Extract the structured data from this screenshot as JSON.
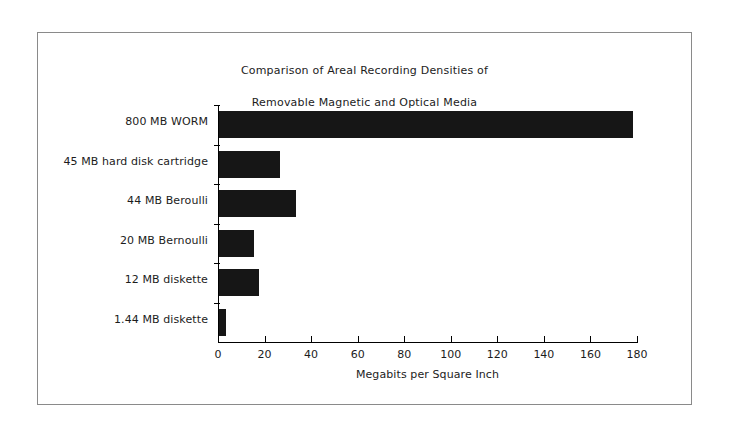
{
  "chart_data": {
    "type": "bar",
    "orientation": "horizontal",
    "title": "Comparison of Areal Recording Densities of\nRemovable Magnetic and Optical Media",
    "title_line1": "Comparison of Areal Recording Densities of",
    "title_line2": "Removable Magnetic and Optical Media",
    "xlabel": "Megabits per Square Inch",
    "ylabel": "",
    "categories": [
      "800 MB WORM",
      "45 MB hard disk cartridge",
      "44 MB Beroulli",
      "20 MB Bernoulli",
      "12 MB diskette",
      "1.44 MB diskette"
    ],
    "values": [
      178,
      26,
      33,
      15,
      17,
      3
    ],
    "xlim": [
      0,
      180
    ],
    "xticks": [
      0,
      20,
      40,
      60,
      80,
      100,
      120,
      140,
      160,
      180
    ],
    "xtick_labels": [
      "0",
      "20",
      "40",
      "60",
      "80",
      "100",
      "120",
      "140",
      "160",
      "180"
    ],
    "grid": false,
    "legend": false,
    "bar_color": "#161616",
    "axis_color": "#000000",
    "background_color": "#ffffff",
    "frame_color": "#8a8a8a"
  }
}
